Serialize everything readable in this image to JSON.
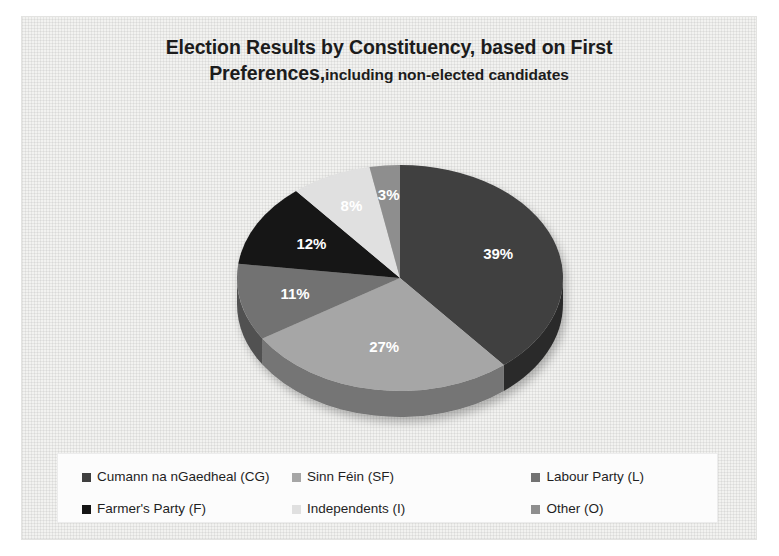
{
  "chart_frame": {
    "background_color": "#f2f2f0",
    "legend_background_color": "#fcfcfc"
  },
  "title": {
    "main": "Election Results by Constituency, based on First",
    "sub_prefix": "Preferences,",
    "sub": "including non-elected candidates",
    "color": "#1c1c1c"
  },
  "legend": {
    "rows": [
      [
        {
          "label": "Cumann na nGaedheal (CG)",
          "color": "#3f3f3f"
        },
        {
          "label": "Sinn Féin (SF)",
          "color": "#a6a6a6"
        },
        {
          "label": "Labour Party (L)",
          "color": "#727272"
        }
      ],
      [
        {
          "label": "Farmer's Party (F)",
          "color": "#151515"
        },
        {
          "label": "Independents (I)",
          "color": "#e0e0e0"
        },
        {
          "label": "Other (O)",
          "color": "#8e8e8e"
        }
      ]
    ]
  },
  "chart_data": {
    "type": "pie",
    "xlabel": "",
    "ylabel": "",
    "legend_position": "bottom",
    "grid": false,
    "three_d": true,
    "value_unit": "percent",
    "categories": [
      "Cumann na nGaedheal (CG)",
      "Sinn Féin (SF)",
      "Labour Party (L)",
      "Farmer's Party (F)",
      "Independents (I)",
      "Other (O)"
    ],
    "values": [
      39,
      27,
      11,
      12,
      8,
      3
    ],
    "data_labels": [
      "39%",
      "27%",
      "11%",
      "12%",
      "8%",
      "3%"
    ],
    "colors": [
      "#3f3f3f",
      "#a6a6a6",
      "#727272",
      "#151515",
      "#e0e0e0",
      "#8e8e8e"
    ],
    "side_colors": [
      "#2c2c2c",
      "#757575",
      "#515151",
      "#0d0d0d",
      "#9e9e9e",
      "#666666"
    ],
    "label_color": "#ffffff",
    "start_angle_deg": 0,
    "direction": "clockwise"
  }
}
